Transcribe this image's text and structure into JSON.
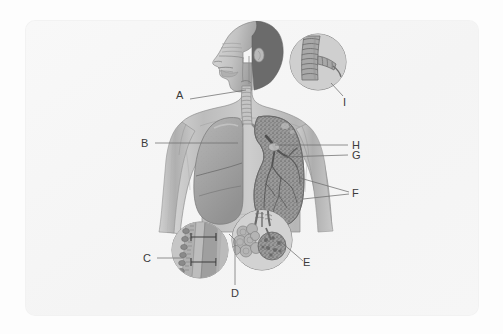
{
  "figure": {
    "type": "labeled anatomical illustration",
    "style": "grayscale pencil/airbrush medical illustration",
    "background_color": "#fdfdfd",
    "card_color": "#f6f6f6",
    "ink_color": "#3a3a3a",
    "leader_color": "#6e6e6e"
  },
  "labels": [
    {
      "id": "A",
      "text": "A",
      "x": 178,
      "y": 95,
      "leader": "M190,99 L246,90",
      "refers_to": "trachea / larynx region",
      "anchor": "right"
    },
    {
      "id": "B",
      "text": "B",
      "x": 143,
      "y": 138,
      "leader": "M155,143 L238,143",
      "refers_to": "left lung (viewer left)",
      "anchor": "right"
    },
    {
      "id": "C",
      "text": "C",
      "x": 145,
      "y": 253,
      "leader": "M157,258 L183,258",
      "refers_to": "ciliated epithelium inset",
      "anchor": "right"
    },
    {
      "id": "D",
      "text": "D",
      "x": 231,
      "y": 289,
      "leader": "M235,286 L235,240 L229,234",
      "refers_to": "bronchiole wall / mucus layer",
      "anchor": "top"
    },
    {
      "id": "E",
      "text": "E",
      "x": 304,
      "y": 258,
      "leader": "M303,261 L281,242",
      "refers_to": "alveolar sac cluster",
      "anchor": "left"
    },
    {
      "id": "F",
      "text": "F",
      "x": 352,
      "y": 188,
      "leader": "M350,193 L300,178 M350,193 L303,198",
      "refers_to": "bronchioles / alveolar ducts",
      "anchor": "left"
    },
    {
      "id": "G",
      "text": "G",
      "x": 352,
      "y": 150,
      "leader": "M349,155 L282,157",
      "refers_to": "secondary bronchus",
      "anchor": "left"
    },
    {
      "id": "H",
      "text": "H",
      "x": 352,
      "y": 140,
      "leader": "M349,145 L275,145",
      "refers_to": "primary bronchus / hilum",
      "anchor": "left"
    },
    {
      "id": "I",
      "text": "I",
      "x": 343,
      "y": 98,
      "leader": "M343,96 L330,84",
      "refers_to": "tracheal cartilage rings inset",
      "anchor": "left"
    }
  ],
  "insets": [
    {
      "name": "bronchus-cartilage-inset",
      "cx": 318,
      "cy": 62,
      "r": 28,
      "content": "trachea bifurcation with C-shaped cartilage rings"
    },
    {
      "name": "epithelium-inset",
      "cx": 200,
      "cy": 250,
      "r": 28,
      "content": "airway wall cross-section: ciliated cells, mucus layer"
    },
    {
      "name": "alveoli-inset",
      "cx": 262,
      "cy": 240,
      "r": 30,
      "content": "two alveolar sac clusters (grape-like)"
    }
  ],
  "anatomy": [
    {
      "name": "head-profile",
      "desc": "left-facing head with nasal cavity, oral cavity, pharynx"
    },
    {
      "name": "trachea",
      "desc": "ringed vertical tube from larynx to carina"
    },
    {
      "name": "left-lung",
      "desc": "solid shaded lung with two lobes, viewer left"
    },
    {
      "name": "right-lung-tree",
      "desc": "lung shown as dense bronchial/alveolar tree, viewer right"
    },
    {
      "name": "torso",
      "desc": "shoulders, arms, chest outline, airbrush shading"
    }
  ]
}
